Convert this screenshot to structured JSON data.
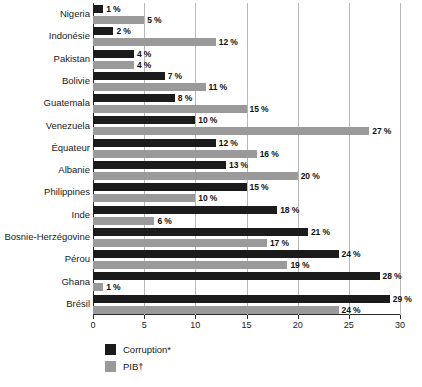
{
  "chart_data": {
    "type": "bar",
    "orientation": "horizontal",
    "title": "",
    "xlabel": "",
    "ylabel": "",
    "xlim": [
      0,
      30
    ],
    "xticks": [
      0,
      5,
      10,
      15,
      20,
      25,
      30
    ],
    "xtick_labels": [
      "0",
      "5",
      "10",
      "15",
      "20",
      "25",
      "30"
    ],
    "grid": true,
    "legend_position": "bottom-left",
    "value_suffix": "%",
    "categories": [
      "Nigeria",
      "Indonésie",
      "Pakistan",
      "Bolivie",
      "Guatemala",
      "Venezuela",
      "Équateur",
      "Albanie",
      "Philippines",
      "Inde",
      "Bosnie-Herzégovine",
      "Pérou",
      "Ghana",
      "Brésil"
    ],
    "series": [
      {
        "name": "Corruption*",
        "color": "#1b1b1b",
        "values": [
          1,
          2,
          4,
          7,
          8,
          10,
          12,
          13,
          15,
          18,
          21,
          24,
          28,
          29
        ],
        "labels": [
          "1 %",
          "2 %",
          "4 %",
          "7 %",
          "8 %",
          "10 %",
          "12 %",
          "13 %",
          "15 %",
          "18 %",
          "21 %",
          "24 %",
          "28 %",
          "29 %"
        ]
      },
      {
        "name": "PIB†",
        "color": "#9a9a9a",
        "values": [
          5,
          12,
          4,
          11,
          15,
          27,
          16,
          20,
          10,
          6,
          17,
          19,
          1,
          24
        ],
        "labels": [
          "5 %",
          "12 %",
          "4 %",
          "11 %",
          "15 %",
          "27 %",
          "16 %",
          "20 %",
          "10 %",
          "6 %",
          "17 %",
          "19 %",
          "1 %",
          "24 %"
        ]
      }
    ]
  },
  "legend": {
    "items": [
      {
        "label": "Corruption*"
      },
      {
        "label": "PIB†"
      }
    ]
  }
}
